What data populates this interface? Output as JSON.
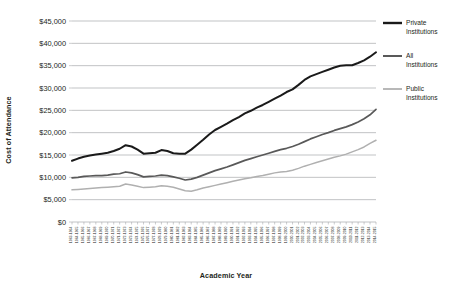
{
  "chart_data": {
    "type": "line",
    "title": "",
    "xlabel": "Academic Year",
    "ylabel": "Cost of Attendance",
    "ylim": [
      0,
      45000
    ],
    "ytick_labels": [
      "$0",
      "$5,000",
      "$10,000",
      "$15,000",
      "$20,000",
      "$25,000",
      "$30,000",
      "$35,000",
      "$40,000",
      "$45,000"
    ],
    "ytick_values": [
      0,
      5000,
      10000,
      15000,
      20000,
      25000,
      30000,
      35000,
      40000,
      45000
    ],
    "grid": true,
    "legend_position": "right",
    "categories": [
      "1963-1964",
      "1964-1965",
      "1965-1966",
      "1966-1967",
      "1967-1968",
      "1968-1969",
      "1969-1970",
      "1970-1971",
      "1971-1972",
      "1972-1973",
      "1973-1974",
      "1974-1975",
      "1975-1976",
      "1976-1977",
      "1977-1978",
      "1978-1979",
      "1979-1980",
      "1980-1981",
      "1981-1982",
      "1982-1983",
      "1983-1984",
      "1984-1985",
      "1985-1986",
      "1986-1987",
      "1987-1988",
      "1988-1989",
      "1989-1990",
      "1990-1991",
      "1991-1992",
      "1992-1993",
      "1993-1994",
      "1994-1995",
      "1995-1996",
      "1996-1997",
      "1997-1998",
      "1998-1999",
      "1999-2000",
      "2000-2001",
      "2001-2002",
      "2002-2003",
      "2003-2004",
      "2004-2005",
      "2005-2006",
      "2006-2007",
      "2007-2008",
      "2008-2009",
      "2009-2010",
      "2010-2011",
      "2011-2012",
      "2012-2013",
      "2013-2014",
      "2014-2015"
    ],
    "series": [
      {
        "name": "Private Institutions",
        "color": "#1a1a1a",
        "values": [
          13700,
          14200,
          14600,
          14900,
          15100,
          15300,
          15500,
          15900,
          16400,
          17200,
          16900,
          16200,
          15300,
          15400,
          15500,
          16100,
          15900,
          15400,
          15300,
          15300,
          16200,
          17300,
          18400,
          19600,
          20600,
          21300,
          22000,
          22800,
          23500,
          24300,
          24900,
          25600,
          26200,
          26900,
          27600,
          28300,
          29100,
          29700,
          30700,
          31800,
          32600,
          33100,
          33600,
          34100,
          34600,
          35000,
          35100,
          35100,
          35600,
          36200,
          37000,
          38000
        ]
      },
      {
        "name": "All Institutions",
        "color": "#595959",
        "values": [
          9900,
          10000,
          10200,
          10300,
          10400,
          10400,
          10500,
          10700,
          10800,
          11200,
          11000,
          10600,
          10100,
          10200,
          10300,
          10500,
          10400,
          10100,
          9800,
          9400,
          9600,
          10000,
          10500,
          11000,
          11500,
          11900,
          12300,
          12800,
          13300,
          13800,
          14200,
          14600,
          15000,
          15400,
          15800,
          16200,
          16500,
          16900,
          17400,
          18000,
          18600,
          19100,
          19600,
          20000,
          20500,
          20900,
          21300,
          21800,
          22400,
          23100,
          24000,
          25200
        ]
      },
      {
        "name": "Public Institutions",
        "color": "#b0b0b0",
        "values": [
          7200,
          7300,
          7400,
          7500,
          7600,
          7700,
          7800,
          7900,
          8000,
          8500,
          8300,
          8000,
          7700,
          7800,
          7900,
          8100,
          8000,
          7800,
          7400,
          7000,
          6900,
          7200,
          7600,
          7900,
          8200,
          8500,
          8800,
          9100,
          9400,
          9700,
          9900,
          10200,
          10400,
          10700,
          11000,
          11200,
          11300,
          11600,
          12000,
          12500,
          12900,
          13300,
          13700,
          14100,
          14500,
          14800,
          15200,
          15700,
          16200,
          16800,
          17600,
          18300
        ]
      }
    ]
  },
  "legend": {
    "items": [
      {
        "label_line1": "Private",
        "label_line2": "Institutions",
        "color": "#1a1a1a"
      },
      {
        "label_line1": "All",
        "label_line2": "Institutions",
        "color": "#595959"
      },
      {
        "label_line1": "Public",
        "label_line2": "Institutions",
        "color": "#b0b0b0"
      }
    ]
  }
}
